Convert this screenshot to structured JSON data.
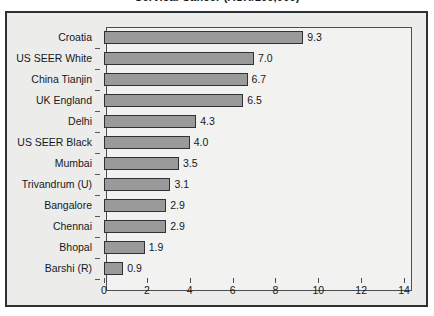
{
  "figure": {
    "title_clipped": "Cervical Cancer (ASR/100,000)",
    "background_color": "#ececeb",
    "plot_background_color": "#f2f2f1",
    "frame_color": "#2d3136",
    "bar_fill_color": "#9a9a9a",
    "bar_edge_color": "#2f3338",
    "text_color": "#15181c"
  },
  "chart_data": {
    "type": "bar",
    "orientation": "horizontal",
    "title": "Cervical Cancer (ASR/100,000)",
    "xlabel": "",
    "ylabel": "",
    "xlim": [
      0,
      14
    ],
    "xticks": [
      0,
      2,
      4,
      6,
      8,
      10,
      12,
      14
    ],
    "xtick_labels": [
      "0",
      "2",
      "4",
      "6",
      "8",
      "10",
      "12",
      "14"
    ],
    "grid": false,
    "legend": false,
    "data_labels": true,
    "categories": [
      "Croatia",
      "US SEER White",
      "China Tianjin",
      "UK England",
      "Delhi",
      "US SEER Black",
      "Mumbai",
      "Trivandrum (U)",
      "Bangalore",
      "Chennai",
      "Bhopal",
      "Barshi (R)"
    ],
    "values": [
      9.3,
      7.0,
      6.7,
      6.5,
      4.3,
      4.0,
      3.5,
      3.1,
      2.9,
      2.9,
      1.9,
      0.9
    ],
    "value_labels": [
      "9.3",
      "7.0",
      "6.7",
      "6.5",
      "4.3",
      "4.0",
      "3.5",
      "3.1",
      "2.9",
      "2.9",
      "1.9",
      "0.9"
    ]
  }
}
